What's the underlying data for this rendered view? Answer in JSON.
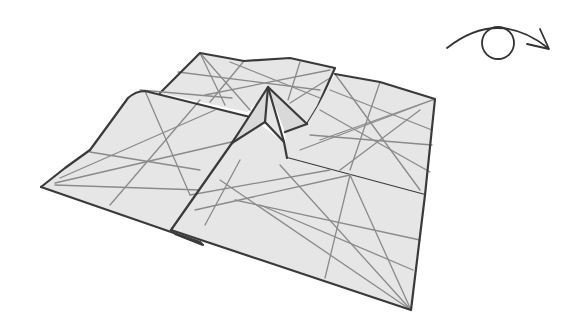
{
  "diagram": {
    "type": "origami-fold-step",
    "symbols": [
      {
        "name": "turn-over",
        "description": "Arc arrow over a circle indicating: turn the model over"
      }
    ],
    "colors": {
      "paper": "#e6e6e6",
      "edge": "#3a3a3a",
      "crease": "#8a8a8a",
      "background": "#ffffff"
    }
  }
}
